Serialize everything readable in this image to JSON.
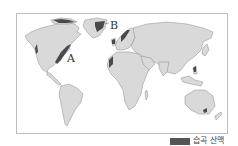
{
  "map": {
    "type": "world-map",
    "labels": {
      "a": "A",
      "b": "B"
    },
    "colors": {
      "land": "#d9d9d9",
      "fold_mountains": "#4a4a4a",
      "frame": "#bdbdbd"
    }
  },
  "legend": {
    "items": [
      {
        "label": "습곡 산맥",
        "color": "#555555"
      }
    ]
  }
}
